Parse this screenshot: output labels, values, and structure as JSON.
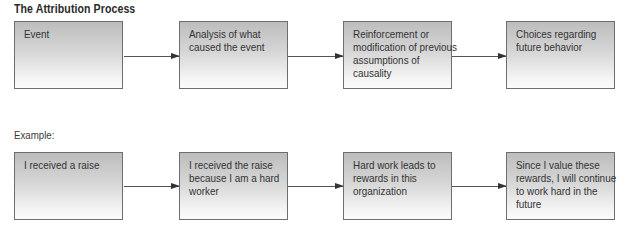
{
  "title": "The Attribution Process",
  "process": {
    "steps": [
      {
        "label": "Event"
      },
      {
        "label": "Analysis of what caused the event"
      },
      {
        "label": "Reinforcement or modification of previous assumptions of causality"
      },
      {
        "label": "Choices regarding future behavior"
      }
    ]
  },
  "example": {
    "label": "Example:",
    "steps": [
      {
        "label": "I received a raise"
      },
      {
        "label": "I received the raise because I am a hard worker"
      },
      {
        "label": "Hard work leads to rewards in this organization"
      },
      {
        "label": "Since I value these rewards, I will continue to work hard in the future"
      }
    ]
  },
  "colors": {
    "box_border": "#6e6e6e",
    "box_gradient_top": "#bdbdbd",
    "box_gradient_bottom": "#fbfbfb",
    "arrow": "#333333"
  }
}
